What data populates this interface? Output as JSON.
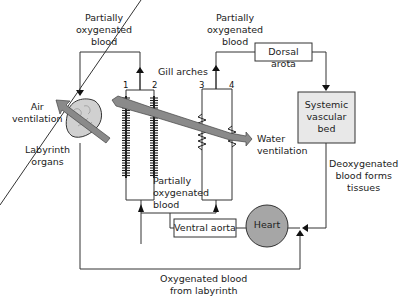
{
  "diagram": {
    "type": "circulatory-flow",
    "labels": {
      "partially_oxygenated_top_left": [
        "Partially",
        "oxygenated",
        "blood"
      ],
      "partially_oxygenated_top_right": [
        "Partially",
        "oxygenated",
        "blood"
      ],
      "partially_oxygenated_bottom": [
        "Partially",
        "oxygenated",
        "blood"
      ],
      "gill_arches": "Gill arches",
      "air_ventilation": [
        "Air",
        "ventilation"
      ],
      "labyrinth_organs": [
        "Labyrinth",
        "organs"
      ],
      "water_ventilation": [
        "Water",
        "ventilation"
      ],
      "deoxygenated": [
        "Deoxygenated",
        "blood forms",
        "tissues"
      ],
      "oxygenated_from_labyrinth": [
        "Oxygenated blood",
        "from labyrinth"
      ]
    },
    "boxes": {
      "dorsal_aorta": "Dorsal arota",
      "systemic": [
        "Systemic",
        "vascular",
        "bed"
      ],
      "ventral_aorta": "Ventral aorta",
      "heart": "Heart"
    },
    "arch_numbers": [
      "1",
      "2",
      "3",
      "4"
    ],
    "colors": {
      "line": "#333333",
      "systemic_fill": "#e8e8e8",
      "heart_fill": "#a6a6a6",
      "arrow_fill": "#8a8a8a",
      "labyrinth_fill": "#d0d0d0"
    }
  }
}
